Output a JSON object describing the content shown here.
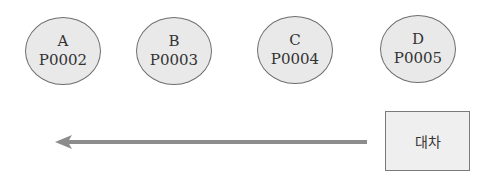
{
  "nodes": [
    {
      "letter": "A",
      "code": "P0002"
    },
    {
      "letter": "B",
      "code": "P0003"
    },
    {
      "letter": "C",
      "code": "P0004"
    },
    {
      "letter": "D",
      "code": "P0005"
    }
  ],
  "box": {
    "label": "대차"
  },
  "arrow": {
    "direction": "left",
    "color": "#8c8c8c"
  },
  "colors": {
    "node_fill": "#e9e9e9",
    "node_border": "#6e6e6e",
    "box_fill": "#efefef"
  }
}
